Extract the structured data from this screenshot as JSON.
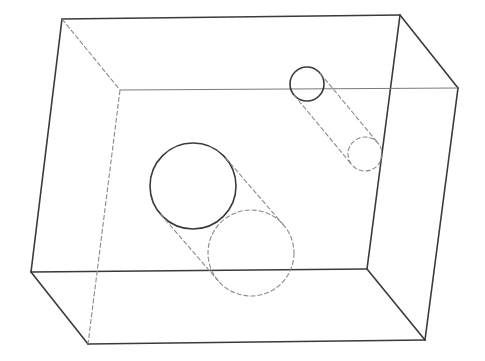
{
  "diagram": {
    "type": "wireframe-3d-block",
    "colors": {
      "visible_edge": "#3a3a3a",
      "hidden_edge": "#8a8a8a",
      "background": "#ffffff"
    },
    "box": {
      "front_face": [
        [
          62,
          19
        ],
        [
          400,
          15
        ],
        [
          367,
          269
        ],
        [
          31,
          272
        ]
      ],
      "back_face": [
        [
          120,
          90
        ],
        [
          458,
          88
        ],
        [
          425,
          340
        ],
        [
          88,
          344
        ]
      ]
    },
    "holes": [
      {
        "name": "small-hole",
        "front_circle": {
          "cx": 307,
          "cy": 84,
          "r": 17
        },
        "back_circle": {
          "cx": 365,
          "cy": 154,
          "r": 17
        }
      },
      {
        "name": "large-hole",
        "front_circle": {
          "cx": 193,
          "cy": 186,
          "r": 43
        },
        "back_circle": {
          "cx": 251,
          "cy": 253,
          "r": 43
        }
      }
    ]
  }
}
